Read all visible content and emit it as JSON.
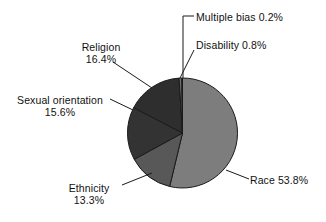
{
  "chart_data": {
    "type": "pie",
    "title": "",
    "subtitle": "",
    "xlabel": "",
    "ylabel": "",
    "legend_position": "none",
    "grid": false,
    "units": "percent",
    "start_angle_deg": 0,
    "direction": "clockwise",
    "categories": [
      "Race",
      "Ethnicity",
      "Sexual orientation",
      "Religion",
      "Disability",
      "Multiple bias"
    ],
    "values": [
      53.8,
      13.3,
      15.6,
      16.4,
      0.8,
      0.2
    ],
    "slices": [
      {
        "label": "Race",
        "value": 53.8,
        "value_text": "53.8%",
        "label_text": "Race 53.8%",
        "color": "#7d7d7d",
        "label_layout": "inline"
      },
      {
        "label": "Ethnicity",
        "value": 13.3,
        "value_text": "13.3%",
        "label_text": "Ethnicity",
        "color": "#585858",
        "label_layout": "stacked"
      },
      {
        "label": "Sexual orientation",
        "value": 15.6,
        "value_text": "15.6%",
        "label_text": "Sexual orientation",
        "color": "#333333",
        "label_layout": "stacked"
      },
      {
        "label": "Religion",
        "value": 16.4,
        "value_text": "16.4%",
        "label_text": "Religion",
        "color": "#2e2e2e",
        "label_layout": "stacked"
      },
      {
        "label": "Disability",
        "value": 0.8,
        "value_text": "0.8%",
        "label_text": "Disability 0.8%",
        "color": "#6f6f6f",
        "label_layout": "inline"
      },
      {
        "label": "Multiple bias",
        "value": 0.2,
        "value_text": "0.2%",
        "label_text": "Multiple bias 0.2%",
        "color": "#3a3a3a",
        "label_layout": "inline"
      }
    ]
  },
  "labels": {
    "multiple_bias": "Multiple bias 0.2%",
    "disability": "Disability 0.8%",
    "religion_name": "Religion",
    "religion_pct": "16.4%",
    "sexual_orientation_name": "Sexual orientation",
    "sexual_orientation_pct": "15.6%",
    "ethnicity_name": "Ethnicity",
    "ethnicity_pct": "13.3%",
    "race": "Race 53.8%"
  },
  "colors": {
    "background": "#ffffff",
    "text": "#111111",
    "leader_line": "#1a1a1a",
    "slice_race": "#7d7d7d",
    "slice_ethnicity": "#585858",
    "slice_sexual_orientation": "#333333",
    "slice_religion": "#2e2e2e",
    "slice_disability": "#6f6f6f",
    "slice_multiple_bias": "#3a3a3a",
    "slice_outline": "#1a1a1a"
  }
}
